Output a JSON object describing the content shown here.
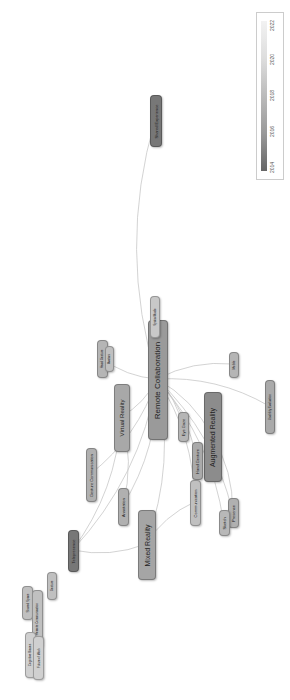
{
  "legend": {
    "title": "Year overlay",
    "ticks": [
      "2014",
      "2016",
      "2018",
      "2020",
      "2022"
    ],
    "colors": [
      "#666666",
      "#999999",
      "#bbbbbb",
      "#dddddd",
      "#f2f2f2"
    ]
  },
  "nodes": [
    {
      "id": "remote_collab",
      "label": "Remote Collaboration",
      "x": 148,
      "y": 320,
      "w": 18,
      "h": 118,
      "font": 8,
      "color": "#9a9a9a"
    },
    {
      "id": "augmented_reality",
      "label": "Augmented Reality",
      "x": 204,
      "y": 392,
      "w": 16,
      "h": 88,
      "font": 7,
      "color": "#8c8c8c"
    },
    {
      "id": "virtual_reality",
      "label": "Virtual Reality",
      "x": 114,
      "y": 384,
      "w": 14,
      "h": 66,
      "font": 6,
      "color": "#a8a8a8"
    },
    {
      "id": "mixed_reality",
      "label": "Mixed Reality",
      "x": 138,
      "y": 510,
      "w": 16,
      "h": 68,
      "font": 7,
      "color": "#a5a5a5"
    },
    {
      "id": "shared_experience",
      "label": "Shared Experience",
      "x": 150,
      "y": 95,
      "w": 10,
      "h": 50,
      "font": 4,
      "color": "#777777"
    },
    {
      "id": "eye_gaze",
      "label": "Eye Gaze",
      "x": 178,
      "y": 412,
      "w": 9,
      "h": 28,
      "font": 4,
      "color": "#b5b5b5"
    },
    {
      "id": "hand_gesture",
      "label": "Hand Gesture",
      "x": 192,
      "y": 442,
      "w": 9,
      "h": 36,
      "font": 4,
      "color": "#aaaaaa"
    },
    {
      "id": "communication",
      "label": "Communication",
      "x": 190,
      "y": 480,
      "w": 9,
      "h": 44,
      "font": 4,
      "color": "#c0c0c0"
    },
    {
      "id": "presence",
      "label": "Presence",
      "x": 228,
      "y": 498,
      "w": 9,
      "h": 28,
      "font": 4,
      "color": "#b0b0b0"
    },
    {
      "id": "sketch",
      "label": "Sketch",
      "x": 219,
      "y": 510,
      "w": 9,
      "h": 24,
      "font": 4,
      "color": "#b8b8b8"
    },
    {
      "id": "annotation",
      "label": "Annotation",
      "x": 118,
      "y": 488,
      "w": 9,
      "h": 36,
      "font": 4,
      "color": "#b0b0b0"
    },
    {
      "id": "gesture_comm",
      "label": "Gesture Communication",
      "x": 86,
      "y": 448,
      "w": 9,
      "h": 52,
      "font": 4,
      "color": "#b0b0b0"
    },
    {
      "id": "telepresence",
      "label": "Telepresence",
      "x": 68,
      "y": 530,
      "w": 9,
      "h": 40,
      "font": 4,
      "color": "#777777"
    },
    {
      "id": "hand_gesture2",
      "label": "Head Gesture",
      "x": 97,
      "y": 340,
      "w": 9,
      "h": 36,
      "font": 3,
      "color": "#b5b5b5"
    },
    {
      "id": "avatars",
      "label": "Avatars",
      "x": 105,
      "y": 346,
      "w": 7,
      "h": 24,
      "font": 3,
      "color": "#c0c0c0"
    },
    {
      "id": "mobile",
      "label": "Mobile",
      "x": 229,
      "y": 352,
      "w": 8,
      "h": 24,
      "font": 3,
      "color": "#b5b5b5"
    },
    {
      "id": "spatial_audio",
      "label": "Spatial Audio",
      "x": 150,
      "y": 296,
      "w": 8,
      "h": 40,
      "font": 3,
      "color": "#c8c8c8"
    },
    {
      "id": "usability",
      "label": "Usability Evaluation",
      "x": 265,
      "y": 380,
      "w": 8,
      "h": 52,
      "font": 3,
      "color": "#aaaaaa"
    },
    {
      "id": "shared_space",
      "label": "Shared Space",
      "x": 22,
      "y": 586,
      "w": 9,
      "h": 32,
      "font": 3,
      "color": "#c0c0c0"
    },
    {
      "id": "remote_comm",
      "label": "Remote Communication",
      "x": 32,
      "y": 590,
      "w": 9,
      "h": 56,
      "font": 3,
      "color": "#c0c0c0"
    },
    {
      "id": "gesture_small",
      "label": "Gesture",
      "x": 47,
      "y": 572,
      "w": 8,
      "h": 26,
      "font": 3,
      "color": "#c0c0c0"
    },
    {
      "id": "cognitive_bias",
      "label": "Cognitive Biases",
      "x": 25,
      "y": 632,
      "w": 9,
      "h": 44,
      "font": 3,
      "color": "#d0d0d0"
    },
    {
      "id": "future",
      "label": "Future of Work",
      "x": 33,
      "y": 636,
      "w": 9,
      "h": 42,
      "font": 3,
      "color": "#d0d0d0"
    }
  ],
  "edges": [
    [
      "remote_collab",
      "shared_experience"
    ],
    [
      "remote_collab",
      "augmented_reality"
    ],
    [
      "remote_collab",
      "virtual_reality"
    ],
    [
      "remote_collab",
      "mixed_reality"
    ],
    [
      "remote_collab",
      "eye_gaze"
    ],
    [
      "remote_collab",
      "hand_gesture"
    ],
    [
      "remote_collab",
      "communication"
    ],
    [
      "remote_collab",
      "presence"
    ],
    [
      "remote_collab",
      "sketch"
    ],
    [
      "remote_collab",
      "annotation"
    ],
    [
      "remote_collab",
      "gesture_comm"
    ],
    [
      "remote_collab",
      "telepresence"
    ],
    [
      "remote_collab",
      "mobile"
    ],
    [
      "remote_collab",
      "hand_gesture2"
    ],
    [
      "remote_collab",
      "usability"
    ],
    [
      "virtual_reality",
      "telepresence"
    ],
    [
      "mixed_reality",
      "telepresence"
    ],
    [
      "augmented_reality",
      "presence"
    ],
    [
      "mixed_reality",
      "communication"
    ],
    [
      "virtual_reality",
      "annotation"
    ]
  ]
}
